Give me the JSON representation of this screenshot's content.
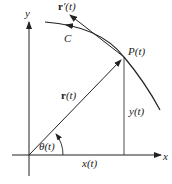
{
  "diagram": {
    "labels": {
      "y_axis": "y",
      "x_axis": "x",
      "derivative_bold": "r",
      "derivative_rest": "′(t)",
      "curve": "C",
      "point": "P(t)",
      "position_bold": "r",
      "position_rest": "(t)",
      "y_component": "y(t)",
      "x_component": "x(t)",
      "angle": "θ(t)"
    },
    "colors": {
      "stroke": "#222222"
    }
  }
}
